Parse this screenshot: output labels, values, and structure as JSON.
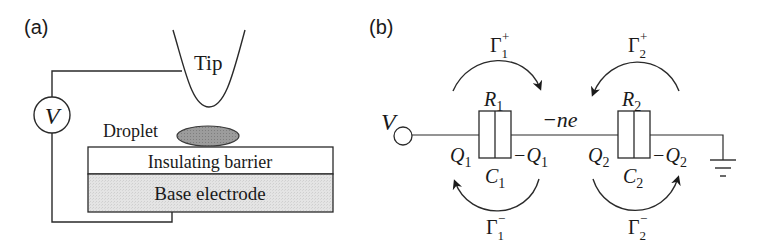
{
  "panel_a": {
    "label": "(a)",
    "tip_label": "Tip",
    "voltage_label": "V",
    "droplet_label": "Droplet",
    "insulating_label": "Insulating barrier",
    "electrode_label": "Base electrode",
    "colors": {
      "droplet_fill": "#9a9a9a",
      "electrode_fill": "#e6e6e6",
      "insulator_fill": "#ffffff",
      "line": "#2a2a2a"
    }
  },
  "panel_b": {
    "label": "(b)",
    "voltage_label": "V",
    "island_charge": "−ne",
    "junction1": {
      "resistor": "R",
      "resistor_sub": "1",
      "capacitor": "C",
      "capacitor_sub": "1",
      "charge_left": "Q",
      "charge_left_sub": "1",
      "charge_right": "−Q",
      "charge_right_sub": "1",
      "rate_forward": "Γ",
      "rate_forward_sub": "1",
      "rate_forward_sup": "+",
      "rate_backward": "Γ",
      "rate_backward_sub": "1",
      "rate_backward_sup": "−"
    },
    "junction2": {
      "resistor": "R",
      "resistor_sub": "2",
      "capacitor": "C",
      "capacitor_sub": "2",
      "charge_left": "Q",
      "charge_left_sub": "2",
      "charge_right": "−Q",
      "charge_right_sub": "2",
      "rate_forward": "Γ",
      "rate_forward_sub": "2",
      "rate_forward_sup": "+",
      "rate_backward": "Γ",
      "rate_backward_sub": "2",
      "rate_backward_sup": "−"
    },
    "ground_icon": "ground-symbol"
  }
}
